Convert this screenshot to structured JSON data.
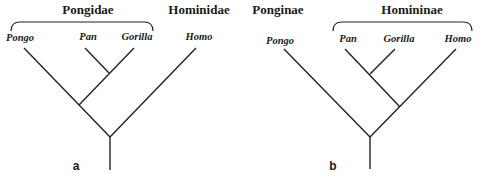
{
  "panels": [
    {
      "label": "a",
      "groups": [
        {
          "name": "Pongidae",
          "members": [
            "Pongo",
            "Pan",
            "Gorilla"
          ]
        },
        {
          "name": "Hominidae",
          "members": [
            "Homo"
          ]
        }
      ],
      "taxa": [
        "Pongo",
        "Pan",
        "Gorilla",
        "Homo"
      ],
      "topology": "((Pongo,(Pan,Gorilla)),Homo)"
    },
    {
      "label": "b",
      "groups": [
        {
          "name": "Ponginae",
          "members": [
            "Pongo"
          ]
        },
        {
          "name": "Homininae",
          "members": [
            "Pan",
            "Gorilla",
            "Homo"
          ]
        }
      ],
      "taxa": [
        "Pongo",
        "Pan",
        "Gorilla",
        "Homo"
      ],
      "topology": "(Pongo,((Pan,Gorilla),Homo))"
    }
  ]
}
